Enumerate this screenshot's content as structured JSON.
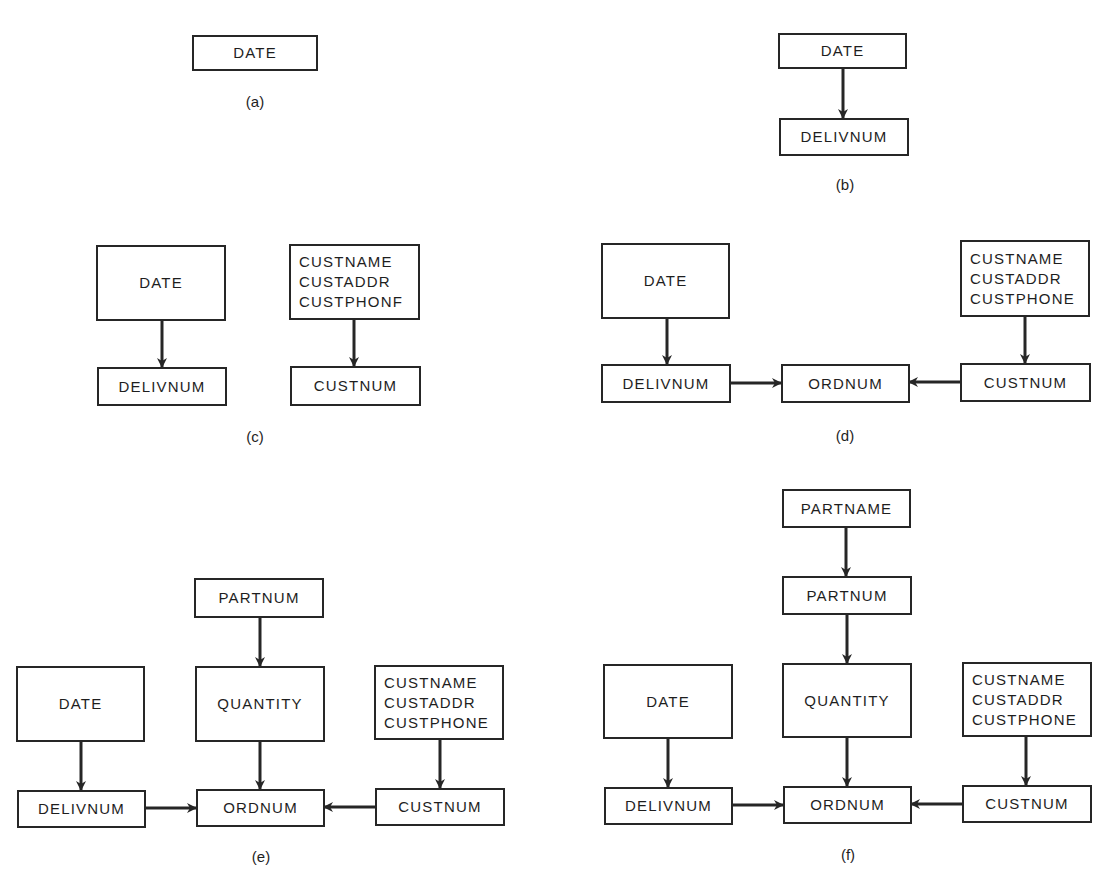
{
  "panels": {
    "a": {
      "caption": "(a)",
      "date": "DATE"
    },
    "b": {
      "caption": "(b)",
      "date": "DATE",
      "delivnum": "DELIVNUM"
    },
    "c": {
      "caption": "(c)",
      "date": "DATE",
      "delivnum": "DELIVNUM",
      "cust": [
        "CUSTNAME",
        "CUSTADDR",
        "CUSTPHONF"
      ],
      "custnum": "CUSTNUM"
    },
    "d": {
      "caption": "(d)",
      "date": "DATE",
      "delivnum": "DELIVNUM",
      "ordnum": "ORDNUM",
      "cust": [
        "CUSTNAME",
        "CUSTADDR",
        "CUSTPHONE"
      ],
      "custnum": "CUSTNUM"
    },
    "e": {
      "caption": "(e)",
      "partnum": "PARTNUM",
      "date": "DATE",
      "quantity": "QUANTITY",
      "cust": [
        "CUSTNAME",
        "CUSTADDR",
        "CUSTPHONE"
      ],
      "delivnum": "DELIVNUM",
      "ordnum": "ORDNUM",
      "custnum": "CUSTNUM"
    },
    "f": {
      "caption": "(f)",
      "partname": "PARTNAME",
      "partnum": "PARTNUM",
      "date": "DATE",
      "quantity": "QUANTITY",
      "cust": [
        "CUSTNAME",
        "CUSTADDR",
        "CUSTPHONE"
      ],
      "delivnum": "DELIVNUM",
      "ordnum": "ORDNUM",
      "custnum": "CUSTNUM"
    }
  },
  "colors": {
    "line": "#262626",
    "background": "#ffffff"
  }
}
